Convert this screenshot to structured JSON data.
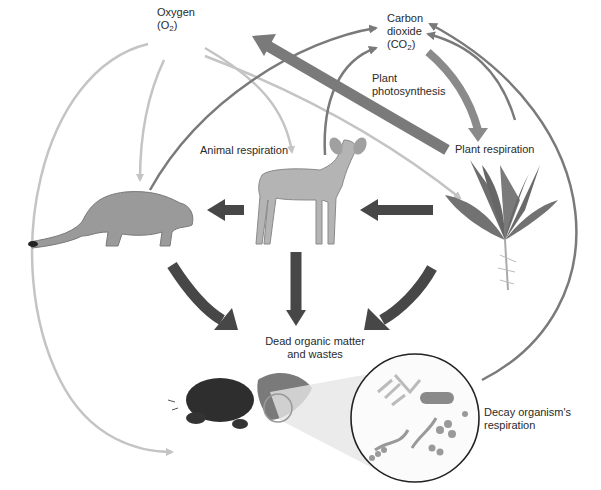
{
  "labels": {
    "oxygen": {
      "line1": "Oxygen",
      "line2_pre": "(O",
      "line2_sub": "2",
      "line2_post": ")"
    },
    "carbon_dioxide": {
      "line1": "Carbon",
      "line2": "dioxide",
      "line3_pre": "(CO",
      "line3_sub": "2",
      "line3_post": ")"
    },
    "plant_photosynthesis": {
      "line1": "Plant",
      "line2": "photosynthesis"
    },
    "plant_respiration": "Plant respiration",
    "animal_respiration": "Animal respiration",
    "dead_organic_matter": {
      "line1": "Dead organic matter",
      "line2": "and wastes"
    },
    "decay_respiration": {
      "line1": "Decay organism's",
      "line2": "respiration"
    }
  },
  "organisms": [
    "cougar",
    "deer",
    "plant",
    "decomposers"
  ],
  "colors": {
    "background": "#ffffff",
    "oxygen_arrow": "#c4c4c4",
    "co2_arrow": "#7a7a7a",
    "food_arrow": "#474747",
    "photosynthesis_arrow": "#8a8a8a",
    "text": "#2a2a2a"
  }
}
